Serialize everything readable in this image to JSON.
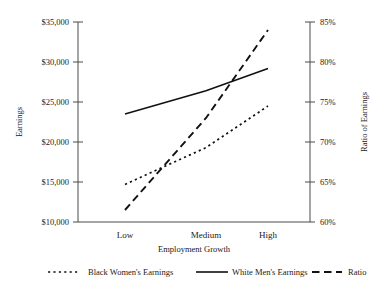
{
  "chart_data": {
    "type": "line",
    "title": "",
    "xlabel": "Employment Growth",
    "ylabel": "Earnings",
    "y2label": "Ratio of Earnings",
    "categories": [
      "Low",
      "Medium",
      "High"
    ],
    "grid": false,
    "legend_position": "bottom",
    "ylim": [
      10000,
      35000
    ],
    "y_ticks": [
      "$10,000",
      "$15,000",
      "$20,000",
      "$25,000",
      "$30,000",
      "$35,000"
    ],
    "y_tick_values": [
      10000,
      15000,
      20000,
      25000,
      30000,
      35000
    ],
    "y2lim": [
      60,
      85
    ],
    "y2_ticks": [
      "60%",
      "65%",
      "70%",
      "75%",
      "80%",
      "85%"
    ],
    "y2_tick_values": [
      60,
      65,
      70,
      75,
      80,
      85
    ],
    "series": [
      {
        "name": "Black Women's Earnings",
        "axis": "left",
        "style": "dotted",
        "values": [
          14700,
          19300,
          24500
        ]
      },
      {
        "name": "White Men's Earnings",
        "axis": "left",
        "style": "solid",
        "values": [
          23500,
          26400,
          29200
        ]
      },
      {
        "name": "Ratio",
        "axis": "right",
        "style": "dashed",
        "values": [
          61.5,
          73.0,
          84.0
        ]
      }
    ]
  },
  "legend": {
    "items": [
      {
        "label": "Black Women's Earnings",
        "style": "dotted"
      },
      {
        "label": "White Men's Earnings",
        "style": "solid"
      },
      {
        "label": "Ratio",
        "style": "dashed"
      }
    ]
  }
}
